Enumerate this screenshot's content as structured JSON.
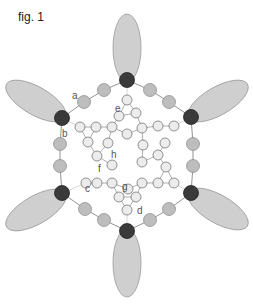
{
  "figure": {
    "title": "fig. 1",
    "colors": {
      "lobe_fill": "#cfcfcf",
      "lobe_stroke": "#9a9a9a",
      "dark_node": "#3a3a3a",
      "grey_node": "#bdbdbd",
      "light_node": "#ececec",
      "edge": "#777777"
    },
    "lobes": [
      {
        "cx": 127,
        "cy": 48,
        "rx": 14,
        "ry": 34,
        "rot": 0
      },
      {
        "cx": 218,
        "cy": 101,
        "rx": 14,
        "ry": 34,
        "rot": 60
      },
      {
        "cx": 218,
        "cy": 209,
        "rx": 14,
        "ry": 34,
        "rot": 120
      },
      {
        "cx": 127,
        "cy": 263,
        "rx": 14,
        "ry": 34,
        "rot": 0
      },
      {
        "cx": 36,
        "cy": 210,
        "rx": 14,
        "ry": 34,
        "rot": 60
      },
      {
        "cx": 36,
        "cy": 101,
        "rx": 14,
        "ry": 34,
        "rot": 120
      }
    ],
    "dark_nodes": [
      {
        "x": 127,
        "y": 80
      },
      {
        "x": 191,
        "y": 117
      },
      {
        "x": 191,
        "y": 193
      },
      {
        "x": 127,
        "y": 231
      },
      {
        "x": 62,
        "y": 193
      },
      {
        "x": 62,
        "y": 118
      }
    ],
    "grey_nodes": [
      {
        "x": 150,
        "y": 90
      },
      {
        "x": 169,
        "y": 102
      },
      {
        "x": 193,
        "y": 144
      },
      {
        "x": 193,
        "y": 166
      },
      {
        "x": 169,
        "y": 209
      },
      {
        "x": 150,
        "y": 220
      },
      {
        "x": 104,
        "y": 220
      },
      {
        "x": 85,
        "y": 209
      },
      {
        "x": 60,
        "y": 166
      },
      {
        "x": 60,
        "y": 144
      },
      {
        "x": 84,
        "y": 102
      },
      {
        "x": 104,
        "y": 90
      }
    ],
    "light_nodes": [
      {
        "x": 127,
        "y": 100
      },
      {
        "x": 119,
        "y": 116
      },
      {
        "x": 136,
        "y": 113
      },
      {
        "x": 80,
        "y": 127
      },
      {
        "x": 96,
        "y": 127
      },
      {
        "x": 112,
        "y": 127
      },
      {
        "x": 127,
        "y": 134
      },
      {
        "x": 142,
        "y": 128
      },
      {
        "x": 158,
        "y": 126
      },
      {
        "x": 174,
        "y": 126
      },
      {
        "x": 88,
        "y": 142
      },
      {
        "x": 108,
        "y": 143
      },
      {
        "x": 143,
        "y": 145
      },
      {
        "x": 165,
        "y": 143
      },
      {
        "x": 97,
        "y": 156
      },
      {
        "x": 112,
        "y": 165
      },
      {
        "x": 142,
        "y": 162
      },
      {
        "x": 158,
        "y": 155
      },
      {
        "x": 166,
        "y": 167
      },
      {
        "x": 86,
        "y": 183
      },
      {
        "x": 97,
        "y": 183
      },
      {
        "x": 112,
        "y": 183
      },
      {
        "x": 128,
        "y": 189
      },
      {
        "x": 142,
        "y": 183
      },
      {
        "x": 158,
        "y": 183
      },
      {
        "x": 174,
        "y": 183
      },
      {
        "x": 119,
        "y": 197
      },
      {
        "x": 136,
        "y": 197
      },
      {
        "x": 127,
        "y": 210
      }
    ],
    "labels": [
      {
        "id": "a",
        "text": "a",
        "x": 72,
        "y": 99
      },
      {
        "id": "b",
        "text": "b",
        "x": 62,
        "y": 137
      },
      {
        "id": "c",
        "text": "c",
        "x": 85,
        "y": 192
      },
      {
        "id": "d",
        "text": "d",
        "x": 137,
        "y": 214
      },
      {
        "id": "e",
        "text": "e",
        "x": 115,
        "y": 112
      },
      {
        "id": "f",
        "text": "f",
        "x": 98,
        "y": 172
      },
      {
        "id": "g",
        "text": "g",
        "x": 122,
        "y": 190
      },
      {
        "id": "h",
        "text": "h",
        "x": 111,
        "y": 158
      }
    ]
  }
}
